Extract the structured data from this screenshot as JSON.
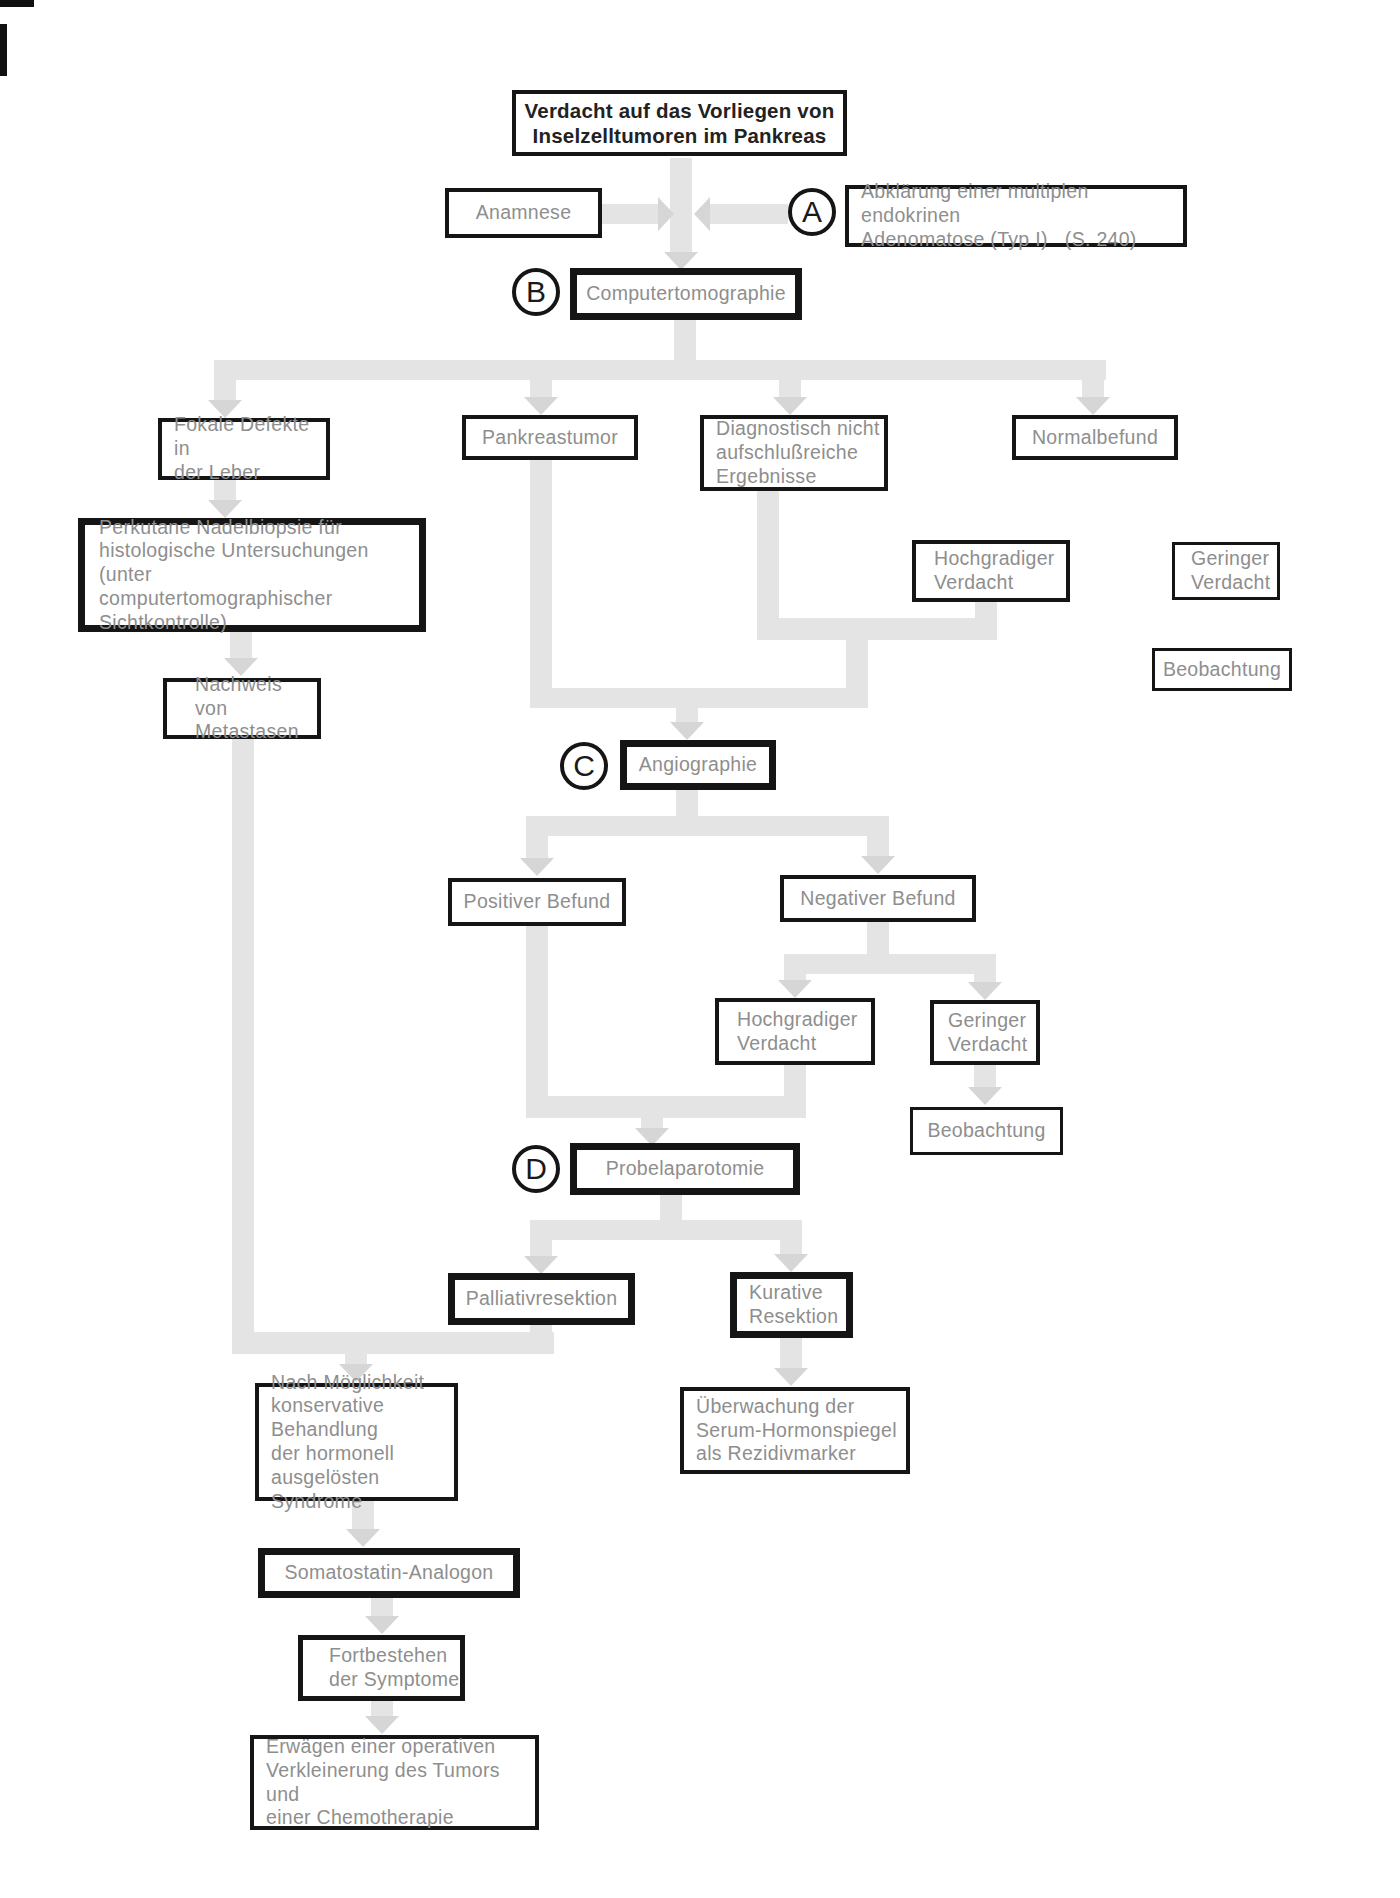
{
  "palette": {
    "line": "#e4e4e4",
    "arrow": "#d6d6d6",
    "box_border": "#151515",
    "box_text": "#8e8e8e",
    "title_text": "#222222",
    "bg": "#ffffff"
  },
  "markers": {
    "a": "A",
    "b": "B",
    "c": "C",
    "d": "D"
  },
  "nodes": {
    "start": {
      "label": "Verdacht auf das Vorliegen von\nInselzelltumoren im Pankreas"
    },
    "anamnese": {
      "label": "Anamnese"
    },
    "abklaerung": {
      "label": "Abklärung einer multiplen endokrinen\nAdenomatose (Typ I)   (S. 240)"
    },
    "computertomographie": {
      "label": "Computertomographie"
    },
    "fokale_defekte": {
      "label": "Fokale Defekte in\nder Leber"
    },
    "pankreastumor": {
      "label": "Pankreastumor"
    },
    "diagnostisch": {
      "label": "Diagnostisch nicht\naufschlußreiche\nErgebnisse"
    },
    "normalbefund": {
      "label": "Normalbefund"
    },
    "perkutane": {
      "label": "Perkutane Nadelbiopsie für\nhistologische Untersuchungen (unter\ncomputertomographischer\nSichtkontrolle)"
    },
    "nachweis": {
      "label": "Nachweis von\nMetastasen"
    },
    "hochgradiger_1": {
      "label": "Hochgradiger\nVerdacht"
    },
    "geringer_1": {
      "label": "Geringer\nVerdacht"
    },
    "beobachtung_1": {
      "label": "Beobachtung"
    },
    "angiographie": {
      "label": "Angiographie"
    },
    "positiver_befund": {
      "label": "Positiver Befund"
    },
    "negativer_befund": {
      "label": "Negativer Befund"
    },
    "hochgradiger_2": {
      "label": "Hochgradiger\nVerdacht"
    },
    "geringer_2": {
      "label": "Geringer\nVerdacht"
    },
    "beobachtung_2": {
      "label": "Beobachtung"
    },
    "probelaparotomie": {
      "label": "Probelaparotomie"
    },
    "palliativresektion": {
      "label": "Palliativresektion"
    },
    "kurative_resektion": {
      "label": "Kurative\nResektion"
    },
    "ueberwachung": {
      "label": "Überwachung der\nSerum-Hormonspiegel\nals Rezidivmarker"
    },
    "nach_moeglichkeit": {
      "label": "Nach Möglichkeit\nkonservative Behandlung\nder hormonell ausgelösten\nSyndrome"
    },
    "somatostatin": {
      "label": "Somatostatin-Analogon"
    },
    "fortbestehen": {
      "label": "Fortbestehen\nder Symptome"
    },
    "erwaegen": {
      "label": "Erwägen einer operativen\nVerkleinerung des Tumors und\neiner Chemotherapie"
    }
  }
}
